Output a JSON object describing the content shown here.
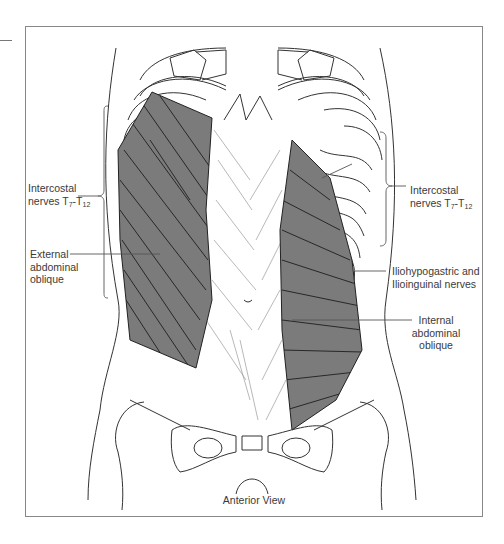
{
  "figure": {
    "view_caption": "Anterior View",
    "colors": {
      "muscle_fill": "#7b7b7b",
      "line": "#333333",
      "frame": "#888888",
      "label_text": "#3a3a3a"
    }
  },
  "labels": {
    "left_intercostal": {
      "line1": "Intercostal",
      "line2_prefix": "nerves T",
      "sub1": "7",
      "dash": "-T",
      "sub2": "12"
    },
    "external_oblique": {
      "line1": "External",
      "line2": "abdominal",
      "line3": "oblique"
    },
    "right_intercostal": {
      "line1": "Intercostal",
      "line2_prefix": "nerves T",
      "sub1": "7",
      "dash": "-T",
      "sub2": "12"
    },
    "iliohypogastric": {
      "line1": "Iliohypogastric and",
      "line2": "Ilioinguinal nerves"
    },
    "internal_oblique": {
      "line1": "Internal",
      "line2": "abdominal",
      "line3": "oblique"
    }
  }
}
